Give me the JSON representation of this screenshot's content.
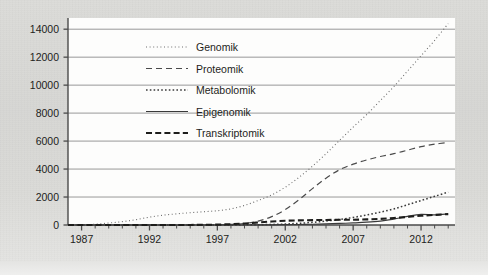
{
  "chart_data": {
    "type": "line",
    "title": "",
    "xlabel": "",
    "ylabel": "",
    "xlim": [
      1986,
      2014.5
    ],
    "ylim": [
      0,
      14800
    ],
    "yticks": [
      0,
      2000,
      4000,
      6000,
      8000,
      10000,
      12000,
      14000
    ],
    "ytick_labels": [
      "0",
      "2000",
      "4000",
      "6000",
      "8000",
      "10000",
      "12000",
      "14000"
    ],
    "xticks": [
      1987,
      1992,
      1997,
      2002,
      2007,
      2012
    ],
    "xtick_labels": [
      "1987",
      "1992",
      "1997",
      "2002",
      "2007",
      "2012"
    ],
    "xtick_minor_step": 1,
    "grid": "horizontal",
    "legend_position": "upper-center-left",
    "x": [
      1986,
      1987,
      1988,
      1989,
      1990,
      1991,
      1992,
      1993,
      1994,
      1995,
      1996,
      1997,
      1998,
      1999,
      2000,
      2001,
      2002,
      2003,
      2004,
      2005,
      2006,
      2007,
      2008,
      2009,
      2010,
      2011,
      2012,
      2013,
      2014
    ],
    "series": [
      {
        "name": "Genomik",
        "style": "fine-dotted",
        "color": "#6e6e6e",
        "values": [
          5,
          15,
          60,
          140,
          240,
          380,
          560,
          700,
          800,
          880,
          950,
          1020,
          1150,
          1400,
          1750,
          2150,
          2700,
          3400,
          4200,
          5100,
          6050,
          7000,
          7900,
          8900,
          9900,
          11000,
          12100,
          13200,
          14400
        ]
      },
      {
        "name": "Proteomik",
        "style": "dashed",
        "color": "#4a4a4a",
        "values": [
          0,
          0,
          0,
          0,
          0,
          0,
          0,
          0,
          0,
          0,
          5,
          15,
          40,
          110,
          280,
          600,
          1100,
          1800,
          2600,
          3350,
          3950,
          4350,
          4650,
          4900,
          5100,
          5350,
          5600,
          5780,
          5900
        ]
      },
      {
        "name": "Metabolomik",
        "style": "dotted",
        "color": "#3a3a3a",
        "values": [
          0,
          0,
          0,
          0,
          0,
          0,
          0,
          0,
          0,
          0,
          0,
          0,
          5,
          10,
          20,
          40,
          70,
          120,
          190,
          280,
          400,
          540,
          720,
          920,
          1150,
          1450,
          1750,
          2050,
          2350
        ]
      },
      {
        "name": "Epigenomik",
        "style": "solid",
        "color": "#3a3a3a",
        "values": [
          0,
          0,
          0,
          0,
          0,
          0,
          0,
          0,
          0,
          0,
          0,
          0,
          0,
          0,
          5,
          10,
          20,
          35,
          55,
          80,
          110,
          150,
          200,
          280,
          420,
          620,
          760,
          720,
          800
        ]
      },
      {
        "name": "Transkriptomik",
        "style": "bold-dashed",
        "color": "#1d1d1b",
        "values": [
          0,
          0,
          0,
          0,
          0,
          0,
          0,
          0,
          0,
          5,
          15,
          30,
          60,
          110,
          180,
          250,
          300,
          330,
          350,
          360,
          370,
          380,
          400,
          440,
          500,
          580,
          660,
          720,
          780
        ]
      }
    ]
  },
  "legend": {
    "items": [
      {
        "label": "Genomik"
      },
      {
        "label": "Proteomik"
      },
      {
        "label": "Metabolomik"
      },
      {
        "label": "Epigenomik"
      },
      {
        "label": "Transkriptomik"
      }
    ]
  }
}
